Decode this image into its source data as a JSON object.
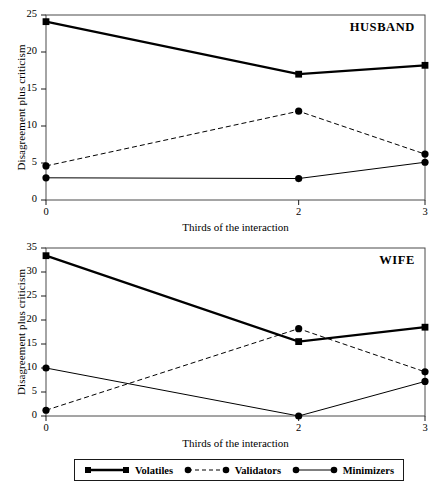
{
  "figure": {
    "background": "#ffffff",
    "ink": "#000000"
  },
  "legend": {
    "position": "below-bottom-panel",
    "entries": [
      {
        "label": "Volatiles",
        "marker": "square",
        "line": "solid",
        "width": 2.3,
        "icon": "legend-swatch-volatiles-icon"
      },
      {
        "label": "Validators",
        "marker": "circle",
        "line": "dashed",
        "width": 1.0,
        "icon": "legend-swatch-validators-icon"
      },
      {
        "label": "Minimizers",
        "marker": "circle",
        "line": "solid",
        "width": 1.0,
        "icon": "legend-swatch-minimizers-icon"
      }
    ]
  },
  "chart_data": [
    {
      "type": "line",
      "title": "HUSBAND",
      "xlabel": "Thirds of the interaction",
      "ylabel": "Disagreement plus criticism",
      "x": [
        0,
        2,
        3
      ],
      "xtick_labels": [
        "0",
        "2",
        "3"
      ],
      "ytick_labels": [
        "0",
        "5",
        "10",
        "15",
        "20",
        "25"
      ],
      "yticks": [
        0,
        5,
        10,
        15,
        20,
        25
      ],
      "xlim": [
        0,
        3
      ],
      "ylim": [
        0,
        25
      ],
      "grid": false,
      "legend_position": "shared-below",
      "series": [
        {
          "name": "Volatiles",
          "values": [
            24.1,
            17.0,
            18.2
          ]
        },
        {
          "name": "Validators",
          "values": [
            4.6,
            12.0,
            6.2
          ]
        },
        {
          "name": "Minimizers",
          "values": [
            3.0,
            2.9,
            5.1
          ]
        }
      ]
    },
    {
      "type": "line",
      "title": "WIFE",
      "xlabel": "Thirds of the interaction",
      "ylabel": "Disagreement plus criticism",
      "x": [
        0,
        2,
        3
      ],
      "xtick_labels": [
        "0",
        "2",
        "3"
      ],
      "ytick_labels": [
        "0",
        "5",
        "10",
        "15",
        "20",
        "25",
        "30",
        "35"
      ],
      "yticks": [
        0,
        5,
        10,
        15,
        20,
        25,
        30,
        35
      ],
      "xlim": [
        0,
        3
      ],
      "ylim": [
        0,
        35
      ],
      "grid": false,
      "legend_position": "shared-below",
      "series": [
        {
          "name": "Volatiles",
          "values": [
            33.4,
            15.5,
            18.5
          ]
        },
        {
          "name": "Validators",
          "values": [
            1.2,
            18.2,
            9.2
          ]
        },
        {
          "name": "Minimizers",
          "values": [
            10.0,
            0.0,
            7.2
          ]
        }
      ]
    }
  ]
}
